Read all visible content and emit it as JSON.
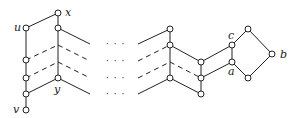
{
  "diagram": {
    "type": "lattice-graph",
    "labels": {
      "x": "x",
      "u": "u",
      "y": "y",
      "v": "v",
      "c": "c",
      "a": "a",
      "b": "b"
    },
    "ellipsis": "· · ·",
    "colors": {
      "stroke": "#222222",
      "background": "#ffffff"
    }
  }
}
